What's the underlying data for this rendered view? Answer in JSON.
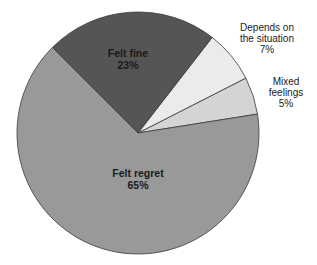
{
  "chart_data": {
    "type": "pie",
    "title": "",
    "categories": [
      "Felt regret",
      "Felt fine",
      "Depends on the situation",
      "Mixed feelings"
    ],
    "values": [
      65,
      23,
      7,
      5
    ],
    "unit": "%",
    "colors": [
      "#999999",
      "#555555",
      "#ebebeb",
      "#d4d4d4"
    ],
    "legend": "none (labels placed on/next to slices)",
    "labels": [
      {
        "line1": "Felt regret",
        "line2": "65%",
        "position": "inside"
      },
      {
        "line1": "Felt fine",
        "line2": "23%",
        "position": "inside"
      },
      {
        "line1": "Depends on",
        "line1b": "the situation",
        "line2": "7%",
        "position": "outside"
      },
      {
        "line1": "Mixed",
        "line1b": "feelings",
        "line2": "5%",
        "position": "outside"
      }
    ]
  }
}
